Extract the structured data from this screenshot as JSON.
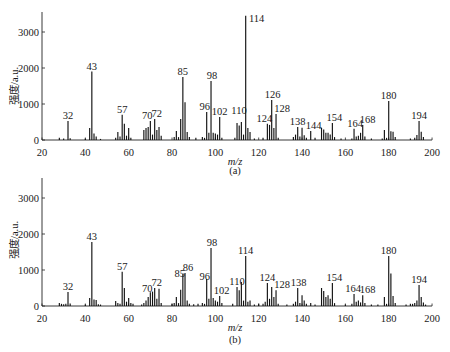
{
  "chart_data": [
    {
      "panel": "a",
      "type": "bar",
      "title": "",
      "caption": "(a)",
      "xlabel": "m/z",
      "ylabel": "强度/a.u.",
      "xlim": [
        20,
        200
      ],
      "ylim": [
        0,
        3600
      ],
      "xticks": [
        20,
        40,
        60,
        80,
        100,
        120,
        140,
        160,
        180,
        200
      ],
      "yticks": [
        0,
        1000,
        2000,
        3000
      ],
      "grid": false,
      "legend": null,
      "series": [
        {
          "name": "spectrum (a)",
          "x": [
            28,
            30,
            32,
            33,
            40,
            42,
            43,
            44,
            45,
            47,
            54,
            55,
            56,
            57,
            58,
            59,
            60,
            61,
            67,
            68,
            69,
            70,
            71,
            72,
            73,
            74,
            75,
            81,
            82,
            83,
            84,
            85,
            86,
            87,
            88,
            91,
            94,
            95,
            96,
            97,
            98,
            99,
            100,
            101,
            102,
            103,
            109,
            110,
            111,
            112,
            113,
            114,
            115,
            116,
            118,
            122,
            124,
            125,
            126,
            127,
            128,
            129,
            136,
            137,
            138,
            139,
            140,
            141,
            142,
            144,
            146,
            149,
            150,
            151,
            152,
            153,
            154,
            155,
            158,
            163,
            164,
            165,
            166,
            167,
            168,
            169,
            172,
            177,
            178,
            179,
            180,
            181,
            182,
            183,
            190,
            192,
            193,
            194,
            195,
            196
          ],
          "y": [
            60,
            40,
            530,
            50,
            40,
            330,
            1900,
            180,
            100,
            30,
            60,
            220,
            100,
            700,
            450,
            120,
            330,
            60,
            280,
            330,
            360,
            530,
            150,
            580,
            280,
            360,
            120,
            80,
            250,
            80,
            580,
            1750,
            1050,
            220,
            80,
            60,
            80,
            60,
            780,
            200,
            1640,
            200,
            180,
            150,
            640,
            60,
            60,
            470,
            400,
            500,
            150,
            3450,
            330,
            220,
            40,
            60,
            450,
            420,
            1110,
            330,
            720,
            60,
            80,
            150,
            360,
            100,
            340,
            130,
            60,
            250,
            60,
            340,
            290,
            200,
            200,
            150,
            470,
            80,
            40,
            40,
            310,
            100,
            120,
            200,
            420,
            100,
            40,
            40,
            280,
            60,
            1080,
            240,
            230,
            80,
            40,
            60,
            140,
            530,
            230,
            80
          ]
        }
      ],
      "annotations": [
        {
          "text": "32",
          "x": 32,
          "dx": 0,
          "dy": 0
        },
        {
          "text": "43",
          "x": 43,
          "dx": 0,
          "dy": 0
        },
        {
          "text": "57",
          "x": 57,
          "dx": 0,
          "dy": 0
        },
        {
          "text": "70",
          "x": 70,
          "dx": -3,
          "dy": 0
        },
        {
          "text": "72",
          "x": 72,
          "dx": 2,
          "dy": 0
        },
        {
          "text": "85",
          "x": 85,
          "dx": 0,
          "dy": 0
        },
        {
          "text": "96",
          "x": 96,
          "dx": -2,
          "dy": 0
        },
        {
          "text": "98",
          "x": 98,
          "dx": 1,
          "dy": 0
        },
        {
          "text": "102",
          "x": 102,
          "dx": 0,
          "dy": 0
        },
        {
          "text": "110",
          "x": 110,
          "dx": 2,
          "dy": -7
        },
        {
          "text": "114",
          "x": 114,
          "dx": 11,
          "dy": 8
        },
        {
          "text": "124",
          "x": 124,
          "dx": -3,
          "dy": 0
        },
        {
          "text": "126",
          "x": 126,
          "dx": 1,
          "dy": 0
        },
        {
          "text": "128",
          "x": 128,
          "dx": 6,
          "dy": 0
        },
        {
          "text": "138",
          "x": 138,
          "dx": 0,
          "dy": 0
        },
        {
          "text": "144",
          "x": 144,
          "dx": 3,
          "dy": 0
        },
        {
          "text": "154",
          "x": 154,
          "dx": 2,
          "dy": 0
        },
        {
          "text": "164",
          "x": 164,
          "dx": 1,
          "dy": 0
        },
        {
          "text": "168",
          "x": 168,
          "dx": 5,
          "dy": 0
        },
        {
          "text": "180",
          "x": 180,
          "dx": 0,
          "dy": 0
        },
        {
          "text": "194",
          "x": 194,
          "dx": 0,
          "dy": 0
        }
      ]
    },
    {
      "panel": "b",
      "type": "bar",
      "title": "",
      "caption": "(b)",
      "xlabel": "m/z",
      "ylabel": "强度/a.u.",
      "xlim": [
        20,
        200
      ],
      "ylim": [
        0,
        3600
      ],
      "xticks": [
        20,
        40,
        60,
        80,
        100,
        120,
        140,
        160,
        180,
        200
      ],
      "yticks": [
        0,
        1000,
        2000,
        3000
      ],
      "grid": false,
      "legend": null,
      "series": [
        {
          "name": "spectrum (b)",
          "x": [
            28,
            29,
            30,
            31,
            32,
            33,
            40,
            42,
            43,
            44,
            45,
            46,
            47,
            54,
            55,
            56,
            57,
            58,
            59,
            60,
            61,
            62,
            66,
            67,
            68,
            69,
            70,
            71,
            72,
            73,
            74,
            75,
            80,
            81,
            82,
            83,
            84,
            85,
            86,
            87,
            88,
            90,
            92,
            94,
            95,
            96,
            97,
            98,
            99,
            100,
            101,
            102,
            103,
            108,
            110,
            111,
            112,
            113,
            114,
            115,
            116,
            118,
            120,
            122,
            123,
            124,
            125,
            126,
            127,
            128,
            129,
            133,
            136,
            137,
            138,
            139,
            140,
            141,
            142,
            144,
            146,
            149,
            150,
            151,
            152,
            153,
            154,
            155,
            160,
            163,
            164,
            165,
            166,
            167,
            168,
            169,
            172,
            175,
            178,
            179,
            180,
            181,
            182,
            183,
            188,
            190,
            191,
            192,
            193,
            194,
            195,
            196,
            197
          ],
          "y": [
            80,
            60,
            50,
            60,
            390,
            70,
            40,
            220,
            1780,
            180,
            170,
            50,
            40,
            140,
            80,
            60,
            950,
            500,
            120,
            220,
            80,
            60,
            40,
            80,
            150,
            250,
            380,
            400,
            500,
            200,
            480,
            80,
            60,
            80,
            250,
            80,
            450,
            890,
            920,
            150,
            60,
            50,
            60,
            80,
            60,
            750,
            200,
            1610,
            220,
            150,
            120,
            280,
            80,
            60,
            530,
            440,
            670,
            150,
            1390,
            120,
            150,
            40,
            60,
            60,
            120,
            640,
            200,
            530,
            250,
            440,
            60,
            40,
            60,
            120,
            500,
            80,
            300,
            150,
            60,
            80,
            40,
            500,
            420,
            250,
            300,
            200,
            640,
            80,
            40,
            60,
            330,
            120,
            150,
            100,
            300,
            80,
            40,
            40,
            250,
            60,
            1390,
            900,
            280,
            80,
            40,
            60,
            60,
            80,
            150,
            580,
            250,
            100,
            40
          ]
        }
      ],
      "annotations": [
        {
          "text": "32",
          "x": 32,
          "dx": 0,
          "dy": 0
        },
        {
          "text": "43",
          "x": 43,
          "dx": 0,
          "dy": 0
        },
        {
          "text": "57",
          "x": 57,
          "dx": 0,
          "dy": 0
        },
        {
          "text": "70",
          "x": 70,
          "dx": -3,
          "dy": 2
        },
        {
          "text": "72",
          "x": 72,
          "dx": 2,
          "dy": 0
        },
        {
          "text": "85",
          "x": 85,
          "dx": -3,
          "dy": 5
        },
        {
          "text": "86",
          "x": 86,
          "dx": 3,
          "dy": 0
        },
        {
          "text": "96",
          "x": 96,
          "dx": -2,
          "dy": 3
        },
        {
          "text": "98",
          "x": 98,
          "dx": 1,
          "dy": 0
        },
        {
          "text": "102",
          "x": 102,
          "dx": 2,
          "dy": 0
        },
        {
          "text": "110",
          "x": 110,
          "dx": 0,
          "dy": 0
        },
        {
          "text": "114",
          "x": 114,
          "dx": 0,
          "dy": 0
        },
        {
          "text": "124",
          "x": 124,
          "dx": 0,
          "dy": 0
        },
        {
          "text": "128",
          "x": 128,
          "dx": 6,
          "dy": 0
        },
        {
          "text": "138",
          "x": 138,
          "dx": 1,
          "dy": 0
        },
        {
          "text": "154",
          "x": 154,
          "dx": 2,
          "dy": 0
        },
        {
          "text": "164",
          "x": 164,
          "dx": -1,
          "dy": 0
        },
        {
          "text": "168",
          "x": 168,
          "dx": 5,
          "dy": 0
        },
        {
          "text": "180",
          "x": 180,
          "dx": 0,
          "dy": 0
        },
        {
          "text": "194",
          "x": 194,
          "dx": 0,
          "dy": 0
        }
      ]
    }
  ]
}
